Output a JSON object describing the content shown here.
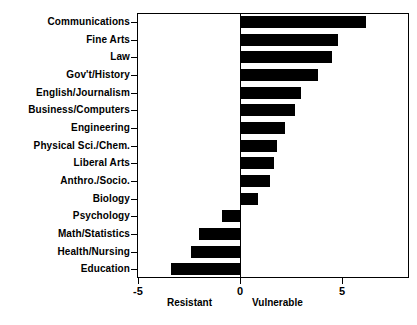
{
  "chart_data": {
    "type": "bar",
    "orientation": "horizontal",
    "title": "",
    "xlabel": "",
    "ylabel": "",
    "xlim": [
      -5,
      8.33
    ],
    "grid": false,
    "legend": null,
    "bar_color": "#000000",
    "axis_color": "#000000",
    "background": "#ffffff",
    "xticks": [
      -5,
      0,
      5
    ],
    "xtick_labels": [
      "-5",
      "0",
      "5"
    ],
    "axis_annotations": {
      "negative_side": "Resistant",
      "positive_side": "Vulnerable"
    },
    "categories": [
      "Communications",
      "Fine Arts",
      "Law",
      "Gov't/History",
      "English/Journalism",
      "Business/Computers",
      "Engineering",
      "Physical Sci./Chem.",
      "Liberal Arts",
      "Anthro./Socio.",
      "Biology",
      "Psychology",
      "Math/Statistics",
      "Health/Nursing",
      "Education"
    ],
    "values": [
      6.2,
      4.8,
      4.5,
      3.8,
      3.0,
      2.7,
      2.2,
      1.8,
      1.65,
      1.45,
      0.9,
      -0.9,
      -2.0,
      -2.4,
      -3.4
    ]
  }
}
